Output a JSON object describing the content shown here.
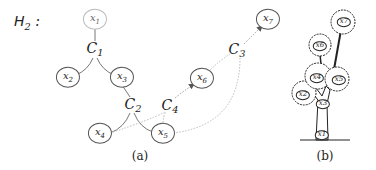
{
  "hypergraph": {
    "title": "H",
    "title_sub": "2",
    "title_suffix": " :",
    "nodes": [
      {
        "id": "x1",
        "label": "x",
        "sub": "1"
      },
      {
        "id": "x2",
        "label": "x",
        "sub": "2"
      },
      {
        "id": "x3",
        "label": "x",
        "sub": "3"
      },
      {
        "id": "x4",
        "label": "x",
        "sub": "4"
      },
      {
        "id": "x5",
        "label": "x",
        "sub": "5"
      },
      {
        "id": "x6",
        "label": "x",
        "sub": "6"
      },
      {
        "id": "x7",
        "label": "x",
        "sub": "7"
      }
    ],
    "hyperedges": [
      {
        "id": "C1",
        "label": "C",
        "sub": "1",
        "members": [
          "x1",
          "x2",
          "x3"
        ],
        "style": "solid"
      },
      {
        "id": "C2",
        "label": "C",
        "sub": "2",
        "members": [
          "x3",
          "x4",
          "x5"
        ],
        "style": "solid"
      },
      {
        "id": "C3",
        "label": "C",
        "sub": "3",
        "members": [
          "x5",
          "x6",
          "x7"
        ],
        "style": "dotted",
        "directed_to": "x7"
      },
      {
        "id": "C4",
        "label": "C",
        "sub": "4",
        "members": [
          "x4",
          "x5",
          "x6"
        ],
        "style": "dotted",
        "directed_to": "x6"
      }
    ],
    "caption": "(a)"
  },
  "tree_illustration": {
    "nodes": [
      "x1",
      "x2",
      "x3",
      "x4",
      "x5",
      "x6",
      "x7"
    ],
    "caption": "(b)"
  }
}
